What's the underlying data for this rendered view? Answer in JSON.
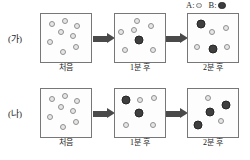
{
  "legend": {
    "entries": [
      {
        "key": "A:",
        "marker": "open-circle-light",
        "name": "particle-a"
      },
      {
        "key": "B:",
        "marker": "filled-circle-dark",
        "name": "particle-b"
      }
    ]
  },
  "captions": {
    "t0": "처음",
    "t1": "1분 후",
    "t2": "2분 후"
  },
  "rows": [
    {
      "label": "(가)",
      "stages": [
        {
          "caption_key": "t0",
          "counts": {
            "A": 8,
            "B": 0
          },
          "particles": [
            {
              "type": "A",
              "x": 22,
              "y": 20
            },
            {
              "type": "A",
              "x": 48,
              "y": 14
            },
            {
              "type": "A",
              "x": 72,
              "y": 26
            },
            {
              "type": "A",
              "x": 40,
              "y": 38
            },
            {
              "type": "A",
              "x": 63,
              "y": 46
            },
            {
              "type": "A",
              "x": 18,
              "y": 58
            },
            {
              "type": "A",
              "x": 70,
              "y": 68
            },
            {
              "type": "A",
              "x": 44,
              "y": 80
            }
          ]
        },
        {
          "caption_key": "t1",
          "counts": {
            "A": 6,
            "B": 1
          },
          "particles": [
            {
              "type": "A",
              "x": 44,
              "y": 14
            },
            {
              "type": "A",
              "x": 12,
              "y": 38
            },
            {
              "type": "A",
              "x": 38,
              "y": 34
            },
            {
              "type": "A",
              "x": 72,
              "y": 26
            },
            {
              "type": "B",
              "x": 48,
              "y": 54
            },
            {
              "type": "A",
              "x": 20,
              "y": 76
            },
            {
              "type": "A",
              "x": 76,
              "y": 74
            }
          ]
        },
        {
          "caption_key": "t2",
          "counts": {
            "A": 4,
            "B": 2
          },
          "particles": [
            {
              "type": "B",
              "x": 26,
              "y": 20
            },
            {
              "type": "A",
              "x": 48,
              "y": 38
            },
            {
              "type": "A",
              "x": 76,
              "y": 30
            },
            {
              "type": "A",
              "x": 18,
              "y": 68
            },
            {
              "type": "B",
              "x": 50,
              "y": 72
            },
            {
              "type": "A",
              "x": 78,
              "y": 68
            }
          ]
        }
      ]
    },
    {
      "label": "(나)",
      "stages": [
        {
          "caption_key": "t0",
          "counts": {
            "A": 8,
            "B": 0
          },
          "particles": [
            {
              "type": "A",
              "x": 22,
              "y": 20
            },
            {
              "type": "A",
              "x": 48,
              "y": 14
            },
            {
              "type": "A",
              "x": 72,
              "y": 26
            },
            {
              "type": "A",
              "x": 40,
              "y": 38
            },
            {
              "type": "A",
              "x": 63,
              "y": 46
            },
            {
              "type": "A",
              "x": 18,
              "y": 58
            },
            {
              "type": "A",
              "x": 70,
              "y": 68
            },
            {
              "type": "A",
              "x": 44,
              "y": 80
            }
          ]
        },
        {
          "caption_key": "t1",
          "counts": {
            "A": 4,
            "B": 2
          },
          "particles": [
            {
              "type": "B",
              "x": 22,
              "y": 22
            },
            {
              "type": "A",
              "x": 50,
              "y": 22
            },
            {
              "type": "A",
              "x": 78,
              "y": 18
            },
            {
              "type": "B",
              "x": 48,
              "y": 50
            },
            {
              "type": "A",
              "x": 22,
              "y": 76
            },
            {
              "type": "A",
              "x": 76,
              "y": 76
            }
          ]
        },
        {
          "caption_key": "t2",
          "counts": {
            "A": 2,
            "B": 3
          },
          "particles": [
            {
              "type": "A",
              "x": 40,
              "y": 18
            },
            {
              "type": "B",
              "x": 76,
              "y": 34
            },
            {
              "type": "B",
              "x": 44,
              "y": 48
            },
            {
              "type": "A",
              "x": 66,
              "y": 66
            },
            {
              "type": "B",
              "x": 20,
              "y": 76
            }
          ]
        }
      ]
    }
  ]
}
